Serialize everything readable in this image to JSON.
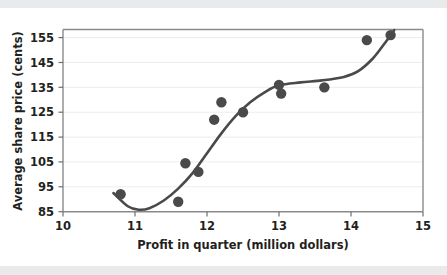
{
  "figure": {
    "background_color": "#ffffff",
    "band_color": "#e9eaec",
    "plot_border_color": "#8a8a8a",
    "gridline_color": "#ededf0",
    "marker_color": "#4a4a4a",
    "curve_color": "#4a4a4a"
  },
  "chart_data": {
    "type": "scatter",
    "title": "",
    "xlabel": "Profit in quarter (million dollars)",
    "ylabel": "Average share price (cents)",
    "xlim": [
      10,
      15
    ],
    "ylim": [
      85,
      158
    ],
    "xticks": [
      10,
      11,
      12,
      13,
      14,
      15
    ],
    "xtick_labels": [
      "10",
      "11",
      "12",
      "13",
      "14",
      "15"
    ],
    "yticks": [
      85,
      95,
      105,
      115,
      125,
      135,
      145,
      155
    ],
    "ytick_labels": [
      "85",
      "95",
      "105",
      "115",
      "125",
      "135",
      "145",
      "155"
    ],
    "grid": "horizontal",
    "legend": "none",
    "series": [
      {
        "name": "Observations",
        "type": "scatter",
        "marker": "circle",
        "color": "#4a4a4a",
        "x": [
          10.8,
          11.6,
          11.7,
          11.88,
          12.1,
          12.2,
          12.5,
          13.0,
          13.03,
          13.63,
          14.22,
          14.55
        ],
        "y": [
          92.0,
          89.0,
          104.5,
          101.0,
          122.0,
          129.0,
          125.0,
          136.0,
          132.5,
          135.0,
          154.0,
          156.0
        ]
      },
      {
        "name": "Fitted trend curve",
        "type": "line",
        "color": "#4a4a4a",
        "x": [
          10.7,
          10.9,
          11.05,
          11.2,
          11.4,
          11.6,
          11.8,
          12.0,
          12.2,
          12.4,
          12.6,
          12.8,
          13.0,
          13.3,
          13.6,
          13.9,
          14.1,
          14.3,
          14.45,
          14.6
        ],
        "y": [
          92.5,
          87.2,
          85.8,
          86.4,
          89.5,
          94.3,
          100.5,
          108.5,
          116.5,
          123.5,
          129.0,
          133.0,
          135.8,
          137.0,
          137.8,
          139.2,
          141.5,
          146.5,
          152.0,
          158.0
        ]
      }
    ]
  }
}
